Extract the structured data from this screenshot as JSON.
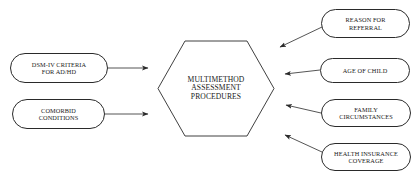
{
  "diagram": {
    "center": {
      "id": "multimethod-assessment-procedures",
      "shape": "hexagon",
      "lines": [
        "MULTIMETHOD",
        "ASSESSMENT",
        "PROCEDURES"
      ],
      "text": "MULTIMETHOD ASSESSMENT PROCEDURES"
    },
    "left_inputs": [
      {
        "id": "dsm-iv-criteria",
        "shape": "rounded-rectangle",
        "lines": [
          "DSM-IV CRITERIA",
          "FOR AD/HD"
        ],
        "line1": "DSM-IV CRITERIA",
        "line2": "FOR AD/HD"
      },
      {
        "id": "comorbid-conditions",
        "shape": "rounded-rectangle",
        "lines": [
          "COMORBID",
          "CONDITIONS"
        ],
        "line1": "COMORBID",
        "line2": "CONDITIONS"
      }
    ],
    "right_inputs": [
      {
        "id": "reason-for-referral",
        "shape": "rounded-rectangle",
        "lines": [
          "REASON FOR",
          "REFERRAL"
        ],
        "line1": "REASON FOR",
        "line2": "REFERRAL"
      },
      {
        "id": "age-of-child",
        "shape": "rounded-rectangle",
        "lines": [
          "AGE OF CHILD"
        ],
        "line1": "AGE OF CHILD",
        "line2": ""
      },
      {
        "id": "family-circumstances",
        "shape": "rounded-rectangle",
        "lines": [
          "FAMILY",
          "CIRCUMSTANCES"
        ],
        "line1": "FAMILY",
        "line2": "CIRCUMSTANCES"
      },
      {
        "id": "health-insurance-coverage",
        "shape": "rounded-rectangle",
        "lines": [
          "HEALTH INSURANCE",
          "COVERAGE"
        ],
        "line1": "HEALTH INSURANCE",
        "line2": "COVERAGE"
      }
    ],
    "connectors": [
      {
        "id": "arrow-dsm-to-center",
        "from": "dsm-iv-criteria",
        "to": "multimethod-assessment-procedures",
        "style": "straight-horizontal"
      },
      {
        "id": "arrow-comorbid-to-center",
        "from": "comorbid-conditions",
        "to": "multimethod-assessment-procedures",
        "style": "straight-horizontal"
      },
      {
        "id": "arrow-referral-to-center",
        "from": "reason-for-referral",
        "to": "multimethod-assessment-procedures",
        "style": "diagonal"
      },
      {
        "id": "arrow-age-to-center",
        "from": "age-of-child",
        "to": "multimethod-assessment-procedures",
        "style": "diagonal"
      },
      {
        "id": "arrow-family-to-center",
        "from": "family-circumstances",
        "to": "multimethod-assessment-procedures",
        "style": "diagonal"
      },
      {
        "id": "arrow-insurance-to-center",
        "from": "health-insurance-coverage",
        "to": "multimethod-assessment-procedures",
        "style": "diagonal"
      }
    ],
    "colors": {
      "stroke": "#2a2a2a",
      "text": "#1a1a1a",
      "background": "#ffffff"
    }
  }
}
